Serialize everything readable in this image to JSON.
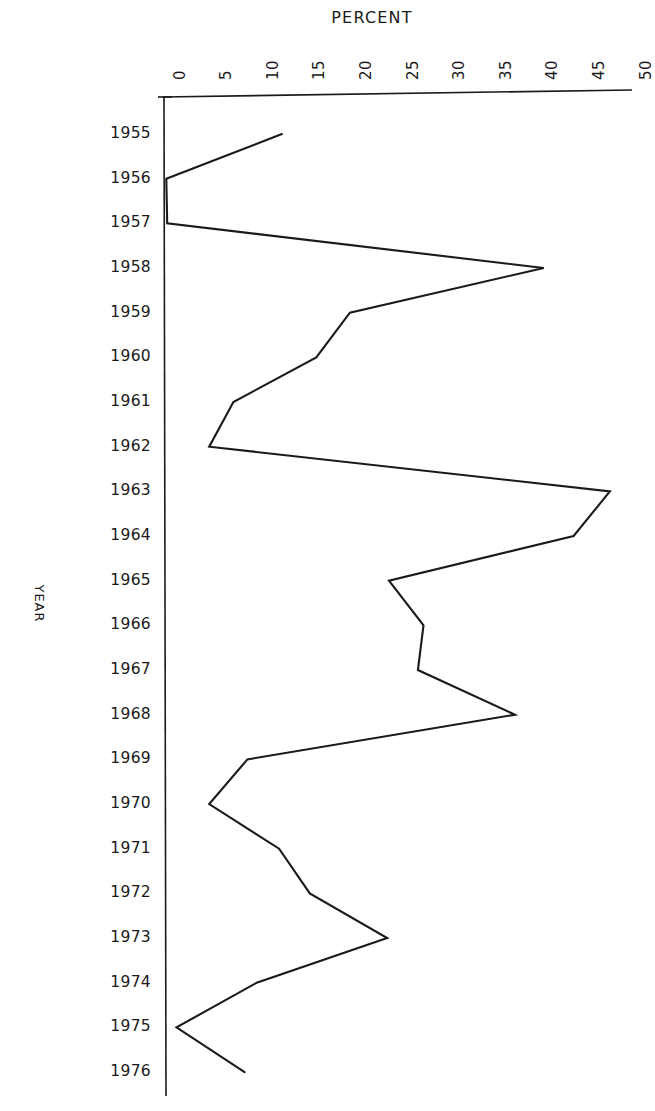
{
  "chart_data": {
    "type": "line",
    "title": "PERCENT",
    "xlabel": "PERCENT",
    "ylabel": "YEAR",
    "orientation": "horizontal",
    "grid": false,
    "legend": null,
    "xlim": [
      0,
      50
    ],
    "xticks": [
      0,
      5,
      10,
      15,
      20,
      25,
      30,
      35,
      40,
      45,
      50
    ],
    "xtick_labels": [
      "0",
      "5",
      "10",
      "15",
      "20",
      "25",
      "30",
      "35",
      "40",
      "45",
      "50"
    ],
    "ylim": [
      1955,
      1976
    ],
    "yticks": [
      1955,
      1956,
      1957,
      1958,
      1959,
      1960,
      1961,
      1962,
      1963,
      1964,
      1965,
      1966,
      1967,
      1968,
      1969,
      1970,
      1971,
      1972,
      1973,
      1974,
      1975,
      1976
    ],
    "ytick_labels": [
      "1955",
      "1956",
      "1957",
      "1958",
      "1959",
      "1960",
      "1961",
      "1962",
      "1963",
      "1964",
      "1965",
      "1966",
      "1967",
      "1968",
      "1969",
      "1970",
      "1971",
      "1972",
      "1973",
      "1974",
      "1975",
      "1976"
    ],
    "categories": [
      1955,
      1956,
      1957,
      1958,
      1959,
      1960,
      1961,
      1962,
      1963,
      1964,
      1965,
      1966,
      1967,
      1968,
      1969,
      1970,
      1971,
      1972,
      1973,
      1974,
      1975,
      1976
    ],
    "values": [
      12.7,
      0.3,
      0.4,
      40.8,
      20.0,
      16.4,
      7.5,
      4.9,
      47.9,
      44.0,
      24.2,
      27.9,
      27.3,
      37.7,
      9.0,
      4.9,
      12.4,
      15.7,
      24.0,
      10.0,
      1.4,
      8.7
    ],
    "series": [
      {
        "name": "percent",
        "values": [
          12.7,
          0.3,
          0.4,
          40.8,
          20.0,
          16.4,
          7.5,
          4.9,
          47.9,
          44.0,
          24.2,
          27.9,
          27.3,
          37.7,
          9.0,
          4.9,
          12.4,
          15.7,
          24.0,
          10.0,
          1.4,
          8.7
        ]
      }
    ],
    "line_color": "#1a1a1a",
    "background_color": "#ffffff"
  },
  "axes": {
    "top_axis_label": "PERCENT",
    "left_axis_label": "YEAR"
  }
}
